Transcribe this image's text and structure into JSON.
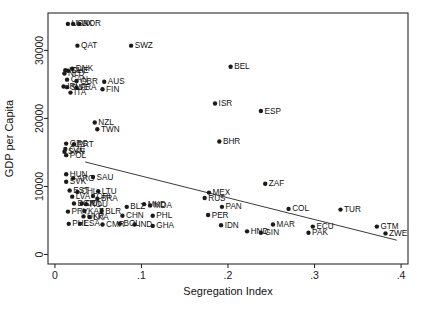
{
  "chart_data": {
    "type": "scatter",
    "title": "",
    "xlabel": "Segregation Index",
    "ylabel": "GDP per Capita",
    "xlim": [
      -0.008,
      0.408
    ],
    "ylim": [
      -1400,
      35500
    ],
    "xticks": [
      0,
      0.1,
      0.2,
      0.3,
      0.4
    ],
    "xticklabels": [
      "0",
      ".1",
      ".2",
      ".3",
      ".4"
    ],
    "yticks": [
      0,
      10000,
      20000,
      30000
    ],
    "yticklabels": [
      "0",
      "10000",
      "20000",
      "30000"
    ],
    "grid": false,
    "legend": false,
    "point_color": "#1b1b1b",
    "line_color": "#3a3a3a",
    "fit_line": {
      "x": [
        0.035,
        0.395
      ],
      "y": [
        13600,
        2100
      ]
    },
    "points": [
      {
        "label": "USA",
        "x": 0.015,
        "y": 33900,
        "lp": "right"
      },
      {
        "label": "LUX",
        "x": 0.021,
        "y": 33900,
        "lp": "right"
      },
      {
        "label": "NOR",
        "x": 0.028,
        "y": 33900,
        "lp": "right"
      },
      {
        "label": "QAT",
        "x": 0.026,
        "y": 30700,
        "lp": "right"
      },
      {
        "label": "SWZ",
        "x": 0.088,
        "y": 30700,
        "lp": "right"
      },
      {
        "label": "ISL",
        "x": 0.012,
        "y": 27100,
        "lp": "right"
      },
      {
        "label": "DNK",
        "x": 0.02,
        "y": 27300,
        "lp": "right"
      },
      {
        "label": "CHE",
        "x": 0.015,
        "y": 27000,
        "lp": "right"
      },
      {
        "label": "NLD",
        "x": 0.011,
        "y": 26600,
        "lp": "right"
      },
      {
        "label": "CAN",
        "x": 0.014,
        "y": 25700,
        "lp": "right"
      },
      {
        "label": "GBR",
        "x": 0.025,
        "y": 25500,
        "lp": "right"
      },
      {
        "label": "AUS",
        "x": 0.057,
        "y": 25400,
        "lp": "right"
      },
      {
        "label": "IRL",
        "x": 0.01,
        "y": 24700,
        "lp": "right"
      },
      {
        "label": "SWE",
        "x": 0.014,
        "y": 24600,
        "lp": "right"
      },
      {
        "label": "FRA",
        "x": 0.025,
        "y": 24500,
        "lp": "right"
      },
      {
        "label": "FIN",
        "x": 0.055,
        "y": 24300,
        "lp": "right"
      },
      {
        "label": "ITA",
        "x": 0.018,
        "y": 23800,
        "lp": "right"
      },
      {
        "label": "NZL",
        "x": 0.046,
        "y": 19400,
        "lp": "right"
      },
      {
        "label": "TWN",
        "x": 0.049,
        "y": 18400,
        "lp": "right"
      },
      {
        "label": "GRC",
        "x": 0.013,
        "y": 16300,
        "lp": "right"
      },
      {
        "label": "PRT",
        "x": 0.022,
        "y": 16200,
        "lp": "right"
      },
      {
        "label": "CZE",
        "x": 0.012,
        "y": 15500,
        "lp": "right"
      },
      {
        "label": "SVN",
        "x": 0.011,
        "y": 15100,
        "lp": "right"
      },
      {
        "label": "POL",
        "x": 0.013,
        "y": 14600,
        "lp": "right"
      },
      {
        "label": "HUN",
        "x": 0.013,
        "y": 11800,
        "lp": "right"
      },
      {
        "label": "ARG",
        "x": 0.021,
        "y": 11200,
        "lp": "right"
      },
      {
        "label": "SAU",
        "x": 0.044,
        "y": 11400,
        "lp": "right"
      },
      {
        "label": "SVK",
        "x": 0.013,
        "y": 10700,
        "lp": "right"
      },
      {
        "label": "EST",
        "x": 0.017,
        "y": 9400,
        "lp": "right"
      },
      {
        "label": "CHL",
        "x": 0.026,
        "y": 9200,
        "lp": "right"
      },
      {
        "label": "LTU",
        "x": 0.05,
        "y": 9300,
        "lp": "right"
      },
      {
        "label": "LVA",
        "x": 0.02,
        "y": 8500,
        "lp": "right"
      },
      {
        "label": "CRI",
        "x": 0.044,
        "y": 8600,
        "lp": "right"
      },
      {
        "label": "BRA",
        "x": 0.049,
        "y": 8200,
        "lp": "right"
      },
      {
        "label": "BGR",
        "x": 0.022,
        "y": 7500,
        "lp": "right"
      },
      {
        "label": "COL_1",
        "x": 0.031,
        "y": 7500,
        "lp": "right"
      },
      {
        "label": "ROU",
        "x": 0.036,
        "y": 7400,
        "lp": "right"
      },
      {
        "label": "BLZ",
        "x": 0.083,
        "y": 7000,
        "lp": "right"
      },
      {
        "label": "PRY",
        "x": 0.015,
        "y": 6300,
        "lp": "right"
      },
      {
        "label": "KAZ",
        "x": 0.034,
        "y": 6400,
        "lp": "right"
      },
      {
        "label": "BLR",
        "x": 0.054,
        "y": 6400,
        "lp": "right"
      },
      {
        "label": "UKR",
        "x": 0.033,
        "y": 5600,
        "lp": "right"
      },
      {
        "label": "LKA",
        "x": 0.04,
        "y": 5500,
        "lp": "right"
      },
      {
        "label": "PHL_1",
        "x": 0.016,
        "y": 4500,
        "lp": "right"
      },
      {
        "label": "ESA",
        "x": 0.029,
        "y": 4500,
        "lp": "right"
      },
      {
        "label": "CMR",
        "x": 0.055,
        "y": 4400,
        "lp": "right"
      },
      {
        "label": "MKD",
        "x": 0.103,
        "y": 7400,
        "lp": "right"
      },
      {
        "label": "MDA",
        "x": 0.11,
        "y": 7200,
        "lp": "right"
      },
      {
        "label": "CHN",
        "x": 0.078,
        "y": 5700,
        "lp": "right"
      },
      {
        "label": "PHL",
        "x": 0.113,
        "y": 5700,
        "lp": "right"
      },
      {
        "label": "BOL",
        "x": 0.075,
        "y": 4500,
        "lp": "right"
      },
      {
        "label": "IND",
        "x": 0.092,
        "y": 4400,
        "lp": "right"
      },
      {
        "label": "GHA",
        "x": 0.113,
        "y": 4200,
        "lp": "right"
      },
      {
        "label": "BEL",
        "x": 0.203,
        "y": 27600,
        "lp": "right"
      },
      {
        "label": "ISR",
        "x": 0.185,
        "y": 22200,
        "lp": "right"
      },
      {
        "label": "ESP",
        "x": 0.238,
        "y": 21100,
        "lp": "right"
      },
      {
        "label": "BHR",
        "x": 0.19,
        "y": 16600,
        "lp": "right"
      },
      {
        "label": "MEX",
        "x": 0.178,
        "y": 9100,
        "lp": "right"
      },
      {
        "label": "ZAF",
        "x": 0.243,
        "y": 10400,
        "lp": "right"
      },
      {
        "label": "RUS",
        "x": 0.173,
        "y": 8300,
        "lp": "right"
      },
      {
        "label": "PAN",
        "x": 0.193,
        "y": 7000,
        "lp": "right"
      },
      {
        "label": "COL",
        "x": 0.27,
        "y": 6700,
        "lp": "right"
      },
      {
        "label": "TUR",
        "x": 0.33,
        "y": 6600,
        "lp": "right"
      },
      {
        "label": "PER",
        "x": 0.177,
        "y": 5800,
        "lp": "right"
      },
      {
        "label": "MAR",
        "x": 0.252,
        "y": 4400,
        "lp": "right"
      },
      {
        "label": "ECU",
        "x": 0.298,
        "y": 4100,
        "lp": "right"
      },
      {
        "label": "GTM",
        "x": 0.372,
        "y": 4100,
        "lp": "right"
      },
      {
        "label": "IDN",
        "x": 0.192,
        "y": 4300,
        "lp": "right"
      },
      {
        "label": "HND",
        "x": 0.222,
        "y": 3400,
        "lp": "right"
      },
      {
        "label": "GIN",
        "x": 0.238,
        "y": 3200,
        "lp": "right"
      },
      {
        "label": "PAK",
        "x": 0.293,
        "y": 3200,
        "lp": "right"
      },
      {
        "label": "ZWE",
        "x": 0.382,
        "y": 3100,
        "lp": "right"
      }
    ]
  }
}
